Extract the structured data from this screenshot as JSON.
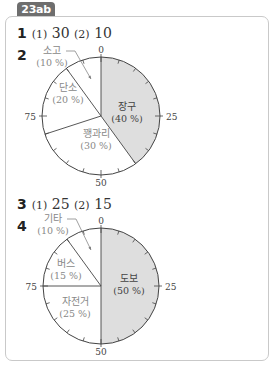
{
  "header": {
    "badge": "23ab"
  },
  "answers": [
    {
      "num": "1",
      "p1": "(1)",
      "v1": "30",
      "p2": "(2)",
      "v2": "10"
    },
    {
      "num": "2"
    },
    {
      "num": "3",
      "p1": "(1)",
      "v1": "25",
      "p2": "(2)",
      "v2": "15"
    },
    {
      "num": "4"
    }
  ],
  "colors": {
    "shaded": "#dedede",
    "line": "#444444",
    "label": "#888888",
    "label_dark": "#444444"
  },
  "chart_data": [
    {
      "type": "pie",
      "title": "2",
      "scale_labels": [
        "0",
        "25",
        "50",
        "75"
      ],
      "slices": [
        {
          "name": "장구",
          "pct_label": "(40 %)",
          "value": 40,
          "shaded": true
        },
        {
          "name": "꽹과리",
          "pct_label": "(30 %)",
          "value": 30,
          "shaded": false
        },
        {
          "name": "단소",
          "pct_label": "(20 %)",
          "value": 20,
          "shaded": false
        },
        {
          "name": "소고",
          "pct_label": "(10 %)",
          "value": 10,
          "shaded": false
        }
      ]
    },
    {
      "type": "pie",
      "title": "4",
      "scale_labels": [
        "0",
        "25",
        "50",
        "75"
      ],
      "slices": [
        {
          "name": "도보",
          "pct_label": "(50 %)",
          "value": 50,
          "shaded": true
        },
        {
          "name": "자전거",
          "pct_label": "(25 %)",
          "value": 25,
          "shaded": false
        },
        {
          "name": "버스",
          "pct_label": "(15 %)",
          "value": 15,
          "shaded": false
        },
        {
          "name": "기타",
          "pct_label": "(10 %)",
          "value": 10,
          "shaded": false
        }
      ]
    }
  ]
}
